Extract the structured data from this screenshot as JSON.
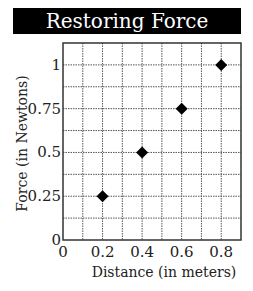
{
  "chart_data": {
    "type": "scatter",
    "title": "Restoring Force",
    "xlabel": "Distance (in meters)",
    "ylabel": "Force (in Newtons)",
    "xlim": [
      0,
      0.9
    ],
    "ylim": [
      0,
      1.125
    ],
    "x_ticks": [
      0,
      0.2,
      0.4,
      0.6,
      0.8
    ],
    "x_tick_labels": [
      "0",
      "0.2",
      "0.4",
      "0.6",
      "0.8"
    ],
    "y_ticks": [
      0,
      0.25,
      0.5,
      0.75,
      1
    ],
    "y_tick_labels": [
      "0",
      "0.25",
      "0.5",
      "0.75",
      "1"
    ],
    "x_grid_step": 0.1,
    "y_grid_step": 0.125,
    "grid": true,
    "marker": "diamond",
    "marker_color": "#000000",
    "series": [
      {
        "name": "Restoring Force",
        "points": [
          {
            "x": 0.2,
            "y": 0.25
          },
          {
            "x": 0.4,
            "y": 0.5
          },
          {
            "x": 0.6,
            "y": 0.75
          },
          {
            "x": 0.8,
            "y": 1.0
          }
        ]
      }
    ]
  }
}
